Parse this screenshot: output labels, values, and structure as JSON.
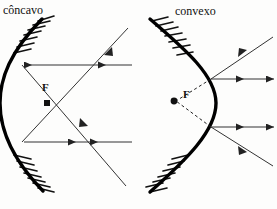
{
  "figure": {
    "title_concave": "côncavo",
    "title_convex": "convexo",
    "focus_label_concave": "F",
    "focus_label_convex": "F",
    "background_color": "#fdfdfc",
    "ink_color": "#111111",
    "ray_color": "#333333",
    "mirror_color": "#000000",
    "canvas": {
      "width": 277,
      "height": 209
    }
  },
  "diagrams": [
    {
      "name": "concave-mirror",
      "label": "côncavo",
      "mirror": {
        "type": "concave",
        "opens_toward": "right",
        "vertex": {
          "x": 2,
          "y": 103
        },
        "top_end": {
          "x": 40,
          "y": 20
        },
        "bottom_end": {
          "x": 40,
          "y": 188
        },
        "hatching_side": "left-back"
      },
      "focus": {
        "label": "F",
        "x": 47,
        "y": 103,
        "real": true
      },
      "rays": [
        {
          "kind": "incident",
          "from": {
            "x": 132,
            "y": 65
          },
          "to": {
            "x": 22,
            "y": 65
          },
          "arrow": "left",
          "style": "solid"
        },
        {
          "kind": "incident",
          "from": {
            "x": 132,
            "y": 142
          },
          "to": {
            "x": 22,
            "y": 142
          },
          "arrow": "left",
          "style": "solid"
        },
        {
          "kind": "reflected",
          "from": {
            "x": 22,
            "y": 65
          },
          "to": {
            "x": 128,
            "y": 188
          },
          "arrow": "mid",
          "style": "solid"
        },
        {
          "kind": "reflected",
          "from": {
            "x": 22,
            "y": 142
          },
          "to": {
            "x": 128,
            "y": 30
          },
          "arrow": "mid",
          "style": "solid"
        }
      ]
    },
    {
      "name": "convex-mirror",
      "label": "convexo",
      "mirror": {
        "type": "convex",
        "opens_toward": "left",
        "vertex": {
          "x": 216,
          "y": 103
        },
        "top_end": {
          "x": 150,
          "y": 20
        },
        "bottom_end": {
          "x": 150,
          "y": 192
        },
        "hatching_side": "left-back"
      },
      "focus": {
        "label": "F",
        "x": 176,
        "y": 101,
        "real": false,
        "virtual": true
      },
      "rays": [
        {
          "kind": "incident",
          "from": {
            "x": 272,
            "y": 38
          },
          "to": {
            "x": 212,
            "y": 79
          },
          "arrow": "mid",
          "style": "solid"
        },
        {
          "kind": "incident",
          "from": {
            "x": 272,
            "y": 166
          },
          "to": {
            "x": 212,
            "y": 127
          },
          "arrow": "mid",
          "style": "solid"
        },
        {
          "kind": "reflected",
          "from": {
            "x": 212,
            "y": 79
          },
          "to": {
            "x": 274,
            "y": 79
          },
          "arrow": "right",
          "style": "solid"
        },
        {
          "kind": "reflected",
          "from": {
            "x": 212,
            "y": 127
          },
          "to": {
            "x": 274,
            "y": 127
          },
          "arrow": "right",
          "style": "solid"
        },
        {
          "kind": "virtual-extension",
          "from": {
            "x": 212,
            "y": 79
          },
          "to": {
            "x": 176,
            "y": 101
          },
          "arrow": "none",
          "style": "dashed"
        },
        {
          "kind": "virtual-extension",
          "from": {
            "x": 212,
            "y": 127
          },
          "to": {
            "x": 176,
            "y": 101
          },
          "arrow": "none",
          "style": "dashed"
        }
      ]
    }
  ]
}
